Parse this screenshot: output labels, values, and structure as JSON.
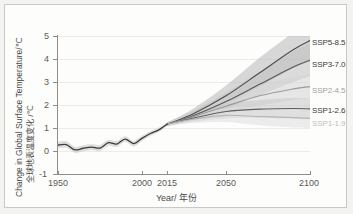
{
  "figure": {
    "background": "#fdfdfc",
    "border_color": "#c9c9c6"
  },
  "axes": {
    "xlabel": "Year/ 年份",
    "ylabel_en": "Change in Global Surface Temperature/℃",
    "ylabel_zh": "全球地表温度变化 /℃",
    "xticks": [
      "1950",
      "2000",
      "2015",
      "2050",
      "2100"
    ],
    "yticks": [
      "5",
      "4",
      "3",
      "2",
      "1",
      "0",
      "-1"
    ]
  },
  "chart_data": {
    "type": "line",
    "title": "",
    "xlabel": "Year/ 年份",
    "ylabel": "Change in Global Surface Temperature/℃",
    "xlim": [
      1950,
      2100
    ],
    "ylim": [
      -1,
      5
    ],
    "xticks": [
      1950,
      2000,
      2015,
      2050,
      2100
    ],
    "yticks": [
      -1,
      0,
      1,
      2,
      3,
      4,
      5
    ],
    "grid": true,
    "legend_position": "right-inline",
    "units": "°C relative to 1850-1900",
    "historical": {
      "name": "historical",
      "color": "#3c3c3c",
      "band_color": "#c9c9c9",
      "x": [
        1950,
        1955,
        1960,
        1965,
        1970,
        1975,
        1980,
        1985,
        1990,
        1995,
        2000,
        2005,
        2010,
        2015
      ],
      "values": [
        0.26,
        0.28,
        0.05,
        0.12,
        0.17,
        0.13,
        0.36,
        0.3,
        0.52,
        0.32,
        0.55,
        0.76,
        0.92,
        1.17
      ],
      "band_low": [
        0.12,
        0.14,
        -0.08,
        -0.01,
        0.04,
        0.0,
        0.23,
        0.17,
        0.4,
        0.2,
        0.44,
        0.66,
        0.83,
        1.09
      ],
      "band_high": [
        0.4,
        0.42,
        0.18,
        0.25,
        0.3,
        0.26,
        0.49,
        0.43,
        0.64,
        0.44,
        0.66,
        0.86,
        1.01,
        1.25
      ]
    },
    "series": [
      {
        "name": "SSP5-8.5",
        "label": "SSP5-8.5",
        "color": "#4d4d4d",
        "label_color": "#3a3a3a",
        "band_color": "#b8b8b8",
        "x": [
          2015,
          2030,
          2050,
          2070,
          2090,
          2100
        ],
        "values": [
          1.17,
          1.6,
          2.4,
          3.4,
          4.4,
          4.8
        ],
        "band_low": [
          1.09,
          1.4,
          2.0,
          2.8,
          3.6,
          3.95
        ],
        "band_high": [
          1.25,
          1.82,
          2.85,
          4.05,
          5.15,
          5.6
        ],
        "end_value": 4.8
      },
      {
        "name": "SSP3-7.0",
        "label": "SSP3-7.0",
        "color": "#565656",
        "label_color": "#3a3a3a",
        "band_color": "#bfbfbf",
        "x": [
          2015,
          2030,
          2050,
          2070,
          2090,
          2100
        ],
        "values": [
          1.17,
          1.52,
          2.15,
          2.9,
          3.65,
          3.95
        ],
        "band_low": [
          1.09,
          1.35,
          1.82,
          2.42,
          3.0,
          3.25
        ],
        "band_high": [
          1.25,
          1.72,
          2.52,
          3.42,
          4.32,
          4.7
        ],
        "end_value": 3.95
      },
      {
        "name": "SSP2-4.5",
        "label": "SSP2-4.5",
        "color": "#9a9a9a",
        "label_color": "#a3a3a3",
        "band_color": "#d4d4d4",
        "x": [
          2015,
          2030,
          2050,
          2070,
          2090,
          2100
        ],
        "values": [
          1.17,
          1.48,
          1.95,
          2.4,
          2.7,
          2.8
        ],
        "band_low": [
          1.09,
          1.32,
          1.65,
          1.98,
          2.22,
          2.3
        ],
        "band_high": [
          1.25,
          1.66,
          2.28,
          2.85,
          3.22,
          3.35
        ],
        "end_value": 2.8
      },
      {
        "name": "SSP1-2.6",
        "label": "SSP1-2.6",
        "color": "#5e5e5e",
        "label_color": "#3a3a3a",
        "band_color": "#c6c6c6",
        "x": [
          2015,
          2030,
          2050,
          2070,
          2090,
          2100
        ],
        "values": [
          1.17,
          1.42,
          1.72,
          1.82,
          1.85,
          1.83
        ],
        "band_low": [
          1.09,
          1.26,
          1.42,
          1.44,
          1.42,
          1.4
        ],
        "band_high": [
          1.25,
          1.6,
          2.04,
          2.22,
          2.3,
          2.3
        ],
        "end_value": 1.83
      },
      {
        "name": "SSP1-1.9",
        "label": "SSP1-1.9",
        "color": "#b5b5b5",
        "label_color": "#bdbdbd",
        "band_color": "#dedede",
        "x": [
          2015,
          2030,
          2050,
          2070,
          2090,
          2100
        ],
        "values": [
          1.17,
          1.38,
          1.55,
          1.5,
          1.45,
          1.42
        ],
        "band_low": [
          1.09,
          1.22,
          1.26,
          1.12,
          1.02,
          1.0
        ],
        "band_high": [
          1.25,
          1.55,
          1.86,
          1.9,
          1.88,
          1.86
        ],
        "end_value": 1.42
      }
    ]
  }
}
